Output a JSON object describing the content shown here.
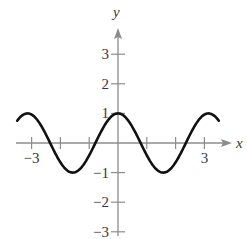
{
  "chart_data": {
    "type": "line",
    "title": "",
    "xlabel": "x",
    "ylabel": "y",
    "xlim": [
      -3.5,
      3.5
    ],
    "ylim": [
      -3,
      3.5
    ],
    "grid": false,
    "legend": null,
    "x_ticks": [
      -3,
      -2,
      -1,
      1,
      2,
      3
    ],
    "x_tick_labels": [
      {
        "value": -3,
        "label": "−3"
      },
      {
        "value": 3,
        "label": "3"
      }
    ],
    "y_ticks": [
      -3,
      -2,
      -1,
      1,
      2,
      3
    ],
    "y_tick_labels": [
      {
        "value": 3,
        "label": "3"
      },
      {
        "value": 2,
        "label": "2"
      },
      {
        "value": 1,
        "label": "1"
      },
      {
        "value": -1,
        "label": "−1"
      },
      {
        "value": -2,
        "label": "−2"
      },
      {
        "value": -3,
        "label": "−3"
      }
    ],
    "series": [
      {
        "name": "y = cos(2x)",
        "function": "cos(2x)",
        "x_range": [
          -3.5,
          3.5
        ],
        "points": [
          [
            -3.5,
            0.75
          ],
          [
            -3.14,
            1.0
          ],
          [
            -2.36,
            0.0
          ],
          [
            -1.57,
            -1.0
          ],
          [
            -0.79,
            0.0
          ],
          [
            0,
            1.0
          ],
          [
            0.79,
            0.0
          ],
          [
            1.57,
            -1.0
          ],
          [
            2.36,
            0.0
          ],
          [
            3.14,
            1.0
          ],
          [
            3.5,
            0.75
          ]
        ]
      }
    ]
  },
  "axis_labels": {
    "x": "x",
    "y": "y"
  },
  "colors": {
    "axis": "#8c8c8c",
    "curve": "#111111",
    "text": "#3a3a3a"
  }
}
